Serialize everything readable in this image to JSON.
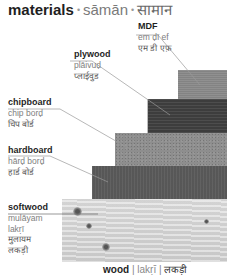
{
  "title": {
    "english": "materials",
    "separator": "•",
    "transliteration": "sāmān",
    "hindi": "सामान"
  },
  "materials": [
    {
      "id": "mdf",
      "english": "MDF",
      "transliteration": "em ḍī ef",
      "hindi": "एम डी एफ़"
    },
    {
      "id": "plywood",
      "english": "plywood",
      "transliteration": "plāivuḍ",
      "hindi": "प्लाईवुड"
    },
    {
      "id": "chipboard",
      "english": "chipboard",
      "transliteration": "chip borḍ",
      "hindi": "चिप बोर्ड"
    },
    {
      "id": "hardboard",
      "english": "hardboard",
      "transliteration": "hārḍ borḍ",
      "hindi": "हार्ड बोर्ड"
    },
    {
      "id": "softwood",
      "english": "softwood",
      "transliteration_line1": "mulāyam",
      "transliteration_line2": "lakṛī",
      "hindi_line1": "मुलायम",
      "hindi_line2": "लकड़ी"
    }
  ],
  "caption": {
    "english": "wood",
    "separator": "|",
    "transliteration": "lakṛī",
    "hindi": "लकड़ी"
  },
  "colors": {
    "mdf": "#8a8a8a",
    "plywood": "#424242",
    "chipboard": "#8e8e8e",
    "hardboard": "#5c5c5c",
    "softwood": "#d8d8d8",
    "leader_line": "#9a9a9a"
  }
}
